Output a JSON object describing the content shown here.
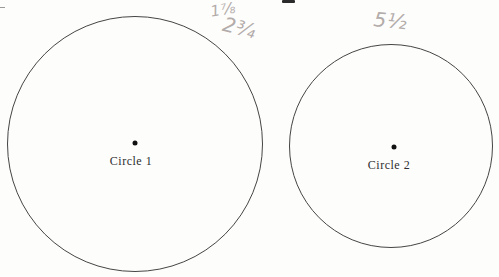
{
  "page": {
    "background": "#fdfdfc",
    "circle_stroke_color": "#454545",
    "pencil_color": "#b3acaa",
    "page_number_fragment": "partial cropped character at top center"
  },
  "circles": [
    {
      "label": "Circle 1",
      "cx": 135,
      "cy": 144,
      "r": 128,
      "dot": {
        "x": 135,
        "y": 143
      },
      "label_pos": {
        "x": 131,
        "y": 154
      }
    },
    {
      "label": "Circle 2",
      "cx": 391,
      "cy": 146,
      "r": 102,
      "dot": {
        "x": 394,
        "y": 147
      },
      "label_pos": {
        "x": 389,
        "y": 158
      }
    }
  ],
  "handwritten_annotations": [
    {
      "text": "1⅞",
      "x": 209,
      "y": 3,
      "rotation": -10,
      "font_size": 15
    },
    {
      "text": "2¾",
      "x": 226,
      "y": 12,
      "rotation": 14,
      "font_size": 20
    },
    {
      "text": "5½",
      "x": 375,
      "y": 7,
      "rotation": 6,
      "font_size": 20
    }
  ]
}
